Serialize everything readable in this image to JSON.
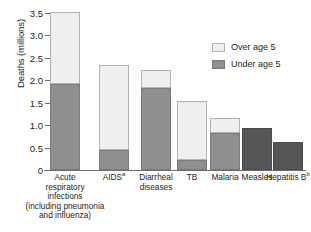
{
  "chart_data": {
    "type": "bar",
    "subtype": "stacked",
    "title": "",
    "xlabel": "",
    "ylabel": "Deaths (millions)",
    "ylim": [
      0,
      3.5
    ],
    "yticks": [
      "0",
      "0.5",
      "1.0",
      "1.5",
      "2.0",
      "2.5",
      "3.0",
      "3.5"
    ],
    "ytick_values": [
      0,
      0.5,
      1.0,
      1.5,
      2.0,
      2.5,
      3.0,
      3.5
    ],
    "grid": false,
    "legend_position": "upper right",
    "categories": [
      "Acute respiratory infections (including pneumonia and influenza)",
      "AIDS",
      "Diarrheal diseases",
      "TB",
      "Malaria",
      "Measles",
      "Hepatitis B"
    ],
    "series": [
      {
        "name": "Under age 5",
        "color": "#8f8f8f",
        "values": [
          1.92,
          0.44,
          1.83,
          0.22,
          0.83,
          0.93,
          0.62
        ]
      },
      {
        "name": "Over age 5",
        "color": "#efefef",
        "values": [
          1.61,
          1.9,
          0.41,
          1.32,
          0.32,
          0.0,
          0.0
        ]
      }
    ],
    "totals": [
      3.53,
      2.34,
      2.24,
      1.54,
      1.15,
      0.93,
      0.62
    ]
  },
  "axis": {
    "ylabel": "Deaths (millions)",
    "ytick_labels": [
      "3.5",
      "3.0",
      "2.5",
      "2.0",
      "1.5",
      "1.0",
      "0.5",
      "0"
    ]
  },
  "legend": {
    "items": [
      {
        "label": "Over age 5",
        "swatch": "over"
      },
      {
        "label": "Under age 5",
        "swatch": "under"
      }
    ]
  },
  "xlabels": [
    {
      "lines": [
        "Acute",
        "respiratory",
        "infections",
        "(including pneumonia",
        "and influenza)"
      ],
      "superscript": ""
    },
    {
      "lines": [
        "AIDS"
      ],
      "superscript": "a"
    },
    {
      "lines": [
        "Diarrheal",
        "diseases"
      ],
      "superscript": ""
    },
    {
      "lines": [
        "TB"
      ],
      "superscript": ""
    },
    {
      "lines": [
        "Malaria"
      ],
      "superscript": ""
    },
    {
      "lines": [
        "Measles"
      ],
      "superscript": ""
    },
    {
      "lines": [
        "Hepatitis B"
      ],
      "superscript": "b"
    }
  ],
  "caption": {
    "text": ""
  }
}
